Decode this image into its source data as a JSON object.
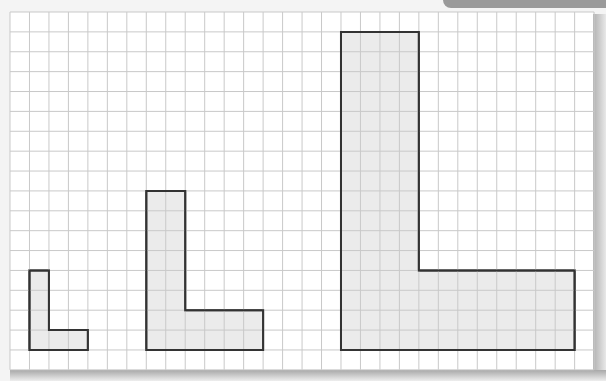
{
  "diagram": {
    "grid": {
      "origin_x": 10,
      "origin_y": 12,
      "cell_w": 19.47,
      "cell_h": 19.88,
      "cols": 30,
      "rows": 18,
      "line_color": "#c9c9c9"
    },
    "shape_style": {
      "fill": "#e8e8e8",
      "stroke": "#333333",
      "stroke_width": 2
    },
    "shapes": [
      {
        "name": "small-l-shape",
        "scale": 1,
        "col": 1,
        "row": 13,
        "stem_w": 1,
        "height": 4,
        "base_w": 3,
        "base_h": 1
      },
      {
        "name": "medium-l-shape",
        "scale": 2,
        "col": 7,
        "row": 9,
        "stem_w": 2,
        "height": 8,
        "base_w": 6,
        "base_h": 2
      },
      {
        "name": "large-l-shape",
        "scale": 4,
        "col": 17,
        "row": 1,
        "stem_w": 4,
        "height": 16,
        "base_w": 12,
        "base_h": 4
      }
    ],
    "colors": {
      "banner": "#9a9a9a",
      "paper": "#ffffff",
      "background": "#f4f4f4"
    }
  }
}
